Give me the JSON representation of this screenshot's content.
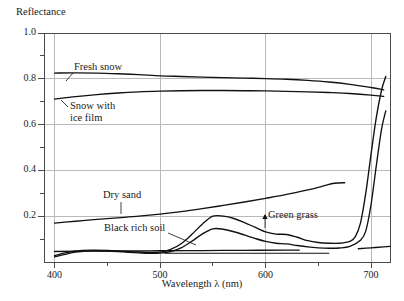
{
  "chart_data": {
    "type": "line",
    "title": "",
    "ylabel": "Reflectance",
    "xlabel": "Wavelength λ (nm)",
    "xlim": [
      390,
      718
    ],
    "ylim": [
      0.0,
      1.0
    ],
    "grid": true,
    "legend_position": "inline-annotations",
    "x_ticks": [
      400,
      450,
      500,
      550,
      600,
      650,
      700
    ],
    "x_tick_labels": [
      "400",
      "",
      "500",
      "",
      "600",
      "",
      "700"
    ],
    "y_ticks": [
      0.0,
      0.1,
      0.2,
      0.3,
      0.4,
      0.5,
      0.6,
      0.7,
      0.8,
      0.9,
      1.0
    ],
    "y_tick_labels": [
      "",
      "",
      "0.2",
      "",
      "0.4",
      "",
      "0.6",
      "",
      "0.8",
      "",
      "1.0"
    ],
    "y_major_labeled": [
      "0.2",
      "0.4",
      "0.6",
      "0.8",
      "1.0"
    ],
    "series": [
      {
        "name": "Fresh snow",
        "x": [
          400,
          420,
          440,
          460,
          480,
          500,
          520,
          540,
          560,
          580,
          600,
          620,
          640,
          660,
          680,
          700,
          712
        ],
        "values": [
          0.825,
          0.826,
          0.825,
          0.822,
          0.818,
          0.813,
          0.81,
          0.807,
          0.805,
          0.803,
          0.801,
          0.798,
          0.793,
          0.786,
          0.776,
          0.762,
          0.752
        ]
      },
      {
        "name": "Snow with ice film",
        "x": [
          400,
          420,
          440,
          460,
          480,
          500,
          520,
          540,
          560,
          580,
          600,
          620,
          640,
          660,
          680,
          700,
          712
        ],
        "values": [
          0.711,
          0.722,
          0.731,
          0.738,
          0.743,
          0.746,
          0.748,
          0.749,
          0.749,
          0.748,
          0.747,
          0.745,
          0.743,
          0.74,
          0.736,
          0.729,
          0.723
        ]
      },
      {
        "name": "Dry sand",
        "x": [
          400,
          420,
          440,
          460,
          480,
          500,
          520,
          540,
          560,
          580,
          600,
          620,
          640,
          655,
          665,
          675
        ],
        "values": [
          0.17,
          0.178,
          0.186,
          0.193,
          0.2,
          0.209,
          0.22,
          0.233,
          0.247,
          0.262,
          0.278,
          0.295,
          0.315,
          0.332,
          0.344,
          0.346
        ]
      },
      {
        "name": "Black rich soil",
        "x": [
          400,
          440,
          480,
          500,
          540,
          580,
          620,
          632
        ],
        "values": [
          0.046,
          0.048,
          0.048,
          0.049,
          0.05,
          0.051,
          0.052,
          0.052
        ]
      },
      {
        "name": "Green grass",
        "x": [
          400,
          410,
          420,
          435,
          450,
          465,
          480,
          490,
          500,
          510,
          520,
          530,
          540,
          550,
          560,
          570,
          580,
          590,
          600,
          610,
          620,
          630,
          640,
          650,
          660,
          670,
          680,
          685,
          690,
          695,
          700,
          705,
          710,
          714
        ],
        "values": [
          0.028,
          0.04,
          0.048,
          0.052,
          0.051,
          0.047,
          0.043,
          0.042,
          0.043,
          0.055,
          0.08,
          0.12,
          0.165,
          0.2,
          0.2,
          0.19,
          0.172,
          0.152,
          0.132,
          0.122,
          0.12,
          0.108,
          0.093,
          0.085,
          0.082,
          0.082,
          0.09,
          0.11,
          0.17,
          0.3,
          0.47,
          0.63,
          0.75,
          0.81
        ]
      },
      {
        "name": "Green grass lower",
        "x": [
          400,
          410,
          420,
          435,
          450,
          465,
          480,
          490,
          500,
          510,
          520,
          530,
          540,
          550,
          560,
          570,
          580,
          590,
          600,
          610,
          620,
          630,
          640,
          650,
          660,
          670,
          680,
          690,
          695,
          700,
          705,
          710,
          714
        ],
        "values": [
          0.022,
          0.033,
          0.043,
          0.049,
          0.048,
          0.044,
          0.04,
          0.038,
          0.039,
          0.046,
          0.062,
          0.09,
          0.122,
          0.145,
          0.143,
          0.132,
          0.118,
          0.103,
          0.09,
          0.082,
          0.079,
          0.072,
          0.066,
          0.062,
          0.06,
          0.061,
          0.068,
          0.095,
          0.135,
          0.25,
          0.42,
          0.58,
          0.66
        ]
      },
      {
        "name": "Baseline flat",
        "x": [
          505,
          560,
          620,
          660
        ],
        "values": [
          0.038,
          0.038,
          0.038,
          0.038
        ]
      },
      {
        "name": "Lower right tail",
        "x": [
          688,
          700,
          712,
          718
        ],
        "values": [
          0.058,
          0.062,
          0.066,
          0.068
        ]
      }
    ],
    "annotations": [
      {
        "id": "fresh-snow",
        "text": "Fresh snow",
        "x": 435,
        "y": 0.88
      },
      {
        "id": "snow-ice-film",
        "text_line1": "Snow with",
        "text_line2": "ice film",
        "x": 412,
        "y": 0.655
      },
      {
        "id": "dry-sand",
        "text": "Dry sand",
        "x": 460,
        "y": 0.265
      },
      {
        "id": "black-rich-soil",
        "text": "Black rich soil",
        "x": 455,
        "y": 0.125
      },
      {
        "id": "green-grass",
        "text": "Green grass",
        "x": 600,
        "y": 0.155
      }
    ],
    "colors": {
      "curve": "#111111",
      "grid": "#b9b9b9",
      "frame": "#4a4a4a",
      "text": "#1a1a1a",
      "background": "#ffffff"
    }
  }
}
